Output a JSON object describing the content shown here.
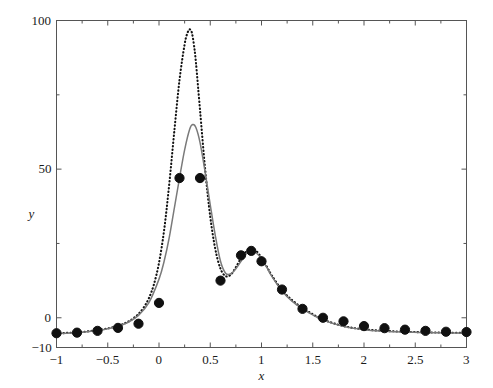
{
  "chart_data": {
    "type": "line",
    "title": "",
    "xlabel": "x",
    "ylabel": "y",
    "xlim": [
      -1,
      3
    ],
    "ylim": [
      -10,
      100
    ],
    "grid": false,
    "legend": "none",
    "xticks": [
      -1,
      -0.5,
      0,
      0.5,
      1,
      1.5,
      2,
      2.5,
      3
    ],
    "xticklabels": [
      "−1",
      "−0.5",
      "0",
      "0.5",
      "1",
      "1.5",
      "2",
      "2.5",
      "3"
    ],
    "yticks": [
      -10,
      0,
      50,
      100
    ],
    "yticklabels": [
      "−10",
      "0",
      "50",
      "100"
    ],
    "xminorticks": [
      -0.75,
      -0.25,
      0.25,
      0.75,
      1.25,
      1.75,
      2.25,
      2.75
    ],
    "yminorticks": [
      25,
      75
    ],
    "series": [
      {
        "name": "true-function-dotted",
        "style": "dotted",
        "color": "#111111",
        "x": [
          -1.0,
          -0.95,
          -0.9,
          -0.85,
          -0.8,
          -0.75,
          -0.7,
          -0.65,
          -0.6,
          -0.55,
          -0.5,
          -0.45,
          -0.4,
          -0.35,
          -0.3,
          -0.25,
          -0.2,
          -0.15,
          -0.1,
          -0.05,
          0.0,
          0.05,
          0.1,
          0.15,
          0.2,
          0.25,
          0.28,
          0.3,
          0.32,
          0.34,
          0.36,
          0.4,
          0.45,
          0.5,
          0.55,
          0.6,
          0.65,
          0.7,
          0.75,
          0.8,
          0.85,
          0.9,
          0.95,
          1.0,
          1.05,
          1.1,
          1.2,
          1.3,
          1.4,
          1.5,
          1.6,
          1.8,
          2.0,
          2.2,
          2.4,
          2.6,
          2.8,
          3.0
        ],
        "y": [
          -5.2,
          -5.2,
          -5.1,
          -5.0,
          -4.9,
          -4.8,
          -4.6,
          -4.4,
          -4.2,
          -3.9,
          -3.6,
          -3.2,
          -2.7,
          -2.1,
          -1.3,
          -0.2,
          1.3,
          3.4,
          6.5,
          11.2,
          18.5,
          29.5,
          45.0,
          63.0,
          80.0,
          92.0,
          96.0,
          97.0,
          96.0,
          92.0,
          86.0,
          70.0,
          50.0,
          34.0,
          23.0,
          16.5,
          14.0,
          14.5,
          17.0,
          20.0,
          22.3,
          23.2,
          22.4,
          20.2,
          17.3,
          14.3,
          9.3,
          5.9,
          3.3,
          1.2,
          -0.6,
          -2.8,
          -3.9,
          -4.4,
          -4.7,
          -4.9,
          -5.0,
          -5.1
        ]
      },
      {
        "name": "fitted-curve-solid",
        "style": "solid",
        "color": "#7a7a7a",
        "x": [
          -1.0,
          -0.9,
          -0.8,
          -0.7,
          -0.6,
          -0.5,
          -0.4,
          -0.3,
          -0.2,
          -0.1,
          0.0,
          0.05,
          0.1,
          0.15,
          0.2,
          0.25,
          0.3,
          0.33,
          0.36,
          0.4,
          0.45,
          0.5,
          0.55,
          0.6,
          0.65,
          0.7,
          0.75,
          0.8,
          0.85,
          0.9,
          0.95,
          1.0,
          1.05,
          1.1,
          1.2,
          1.3,
          1.4,
          1.5,
          1.6,
          1.8,
          2.0,
          2.2,
          2.4,
          2.6,
          2.8,
          3.0
        ],
        "y": [
          -5.3,
          -5.2,
          -5.0,
          -4.7,
          -4.3,
          -3.7,
          -2.8,
          -1.5,
          0.8,
          5.0,
          13.0,
          19.0,
          27.0,
          37.0,
          47.0,
          56.5,
          63.5,
          65.0,
          64.0,
          59.0,
          49.0,
          38.0,
          27.5,
          19.0,
          15.0,
          14.8,
          16.5,
          19.0,
          21.5,
          22.5,
          21.8,
          19.8,
          17.0,
          14.0,
          9.0,
          5.5,
          3.0,
          1.0,
          -0.8,
          -2.9,
          -4.0,
          -4.5,
          -4.8,
          -5.0,
          -5.1,
          -5.2
        ]
      }
    ],
    "points": {
      "name": "sample-data-points",
      "marker": "filled-circle",
      "color": "#101010",
      "x": [
        -1.0,
        -0.8,
        -0.6,
        -0.4,
        -0.2,
        0.0,
        0.2,
        0.4,
        0.6,
        0.8,
        0.9,
        1.0,
        1.2,
        1.4,
        1.6,
        1.8,
        2.0,
        2.2,
        2.4,
        2.6,
        2.8,
        3.0
      ],
      "y": [
        -5.2,
        -5.0,
        -4.4,
        -3.4,
        -2.0,
        5.0,
        47.0,
        47.0,
        12.5,
        21.0,
        22.5,
        19.0,
        9.5,
        3.0,
        0.0,
        -1.2,
        -2.8,
        -3.5,
        -4.0,
        -4.4,
        -4.7,
        -4.8
      ]
    }
  },
  "figure": {
    "background": "#ffffff",
    "axis_color": "#555555",
    "text_color": "#1a1a1a"
  }
}
